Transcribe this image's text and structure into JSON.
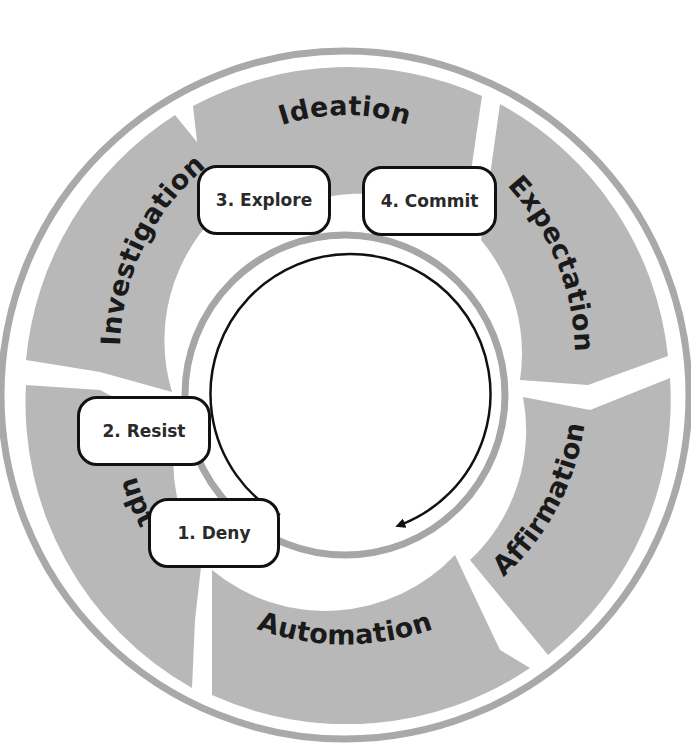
{
  "diagram": {
    "type": "cycle",
    "colors": {
      "segment_fill": "#b8b8b8",
      "ring_stroke": "#a6a6a6",
      "arrow_stroke": "#111111",
      "stage_box_border": "#111111",
      "stage_box_fill": "#ffffff",
      "label_color": "#1a1a1a"
    },
    "outer_segments": [
      {
        "label": "Ideation",
        "position": "top"
      },
      {
        "label": "Expectation",
        "position": "upper-right"
      },
      {
        "label": "Affirmation",
        "position": "lower-right"
      },
      {
        "label": "Automation",
        "position": "bottom"
      },
      {
        "label": "upt",
        "position": "lower-left",
        "note": "partially obscured label"
      },
      {
        "label": "Investigation",
        "position": "upper-left"
      }
    ],
    "stages": [
      {
        "label": "1. Deny"
      },
      {
        "label": "2. Resist"
      },
      {
        "label": "3. Explore"
      },
      {
        "label": "4. Commit"
      }
    ],
    "center_arrow": {
      "direction": "clockwise"
    }
  }
}
